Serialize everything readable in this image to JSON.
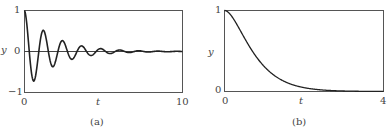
{
  "chart_data": [
    {
      "type": "line",
      "panel": "a",
      "caption": "(a)",
      "xlabel": "t",
      "ylabel": "y",
      "xlim": [
        0,
        10
      ],
      "ylim": [
        -1,
        1
      ],
      "xticks": [
        "0",
        "10"
      ],
      "yticks": [
        "1",
        "0",
        "−1"
      ],
      "grid": false,
      "zero_line": true,
      "model": "y = e^(-0.55 t) cos(5.2 t)",
      "series": [
        {
          "name": "y(t) underdamped",
          "x": [
            0,
            0.3,
            0.6,
            0.9,
            1.2,
            1.5,
            1.8,
            2.1,
            2.4,
            2.7,
            3.0,
            3.6,
            4.2,
            5.0,
            6.0,
            8.0,
            10.0
          ],
          "y": [
            1.0,
            0.0,
            -0.55,
            -0.05,
            0.25,
            0.02,
            -0.17,
            0.0,
            0.07,
            0.0,
            -0.04,
            0.02,
            -0.01,
            0.0,
            0.0,
            0.0,
            0.0
          ]
        }
      ]
    },
    {
      "type": "line",
      "panel": "b",
      "caption": "(b)",
      "xlabel": "t",
      "ylabel": "y",
      "xlim": [
        0,
        4
      ],
      "ylim": [
        0,
        1
      ],
      "xticks": [
        "0",
        "4"
      ],
      "yticks": [
        "1",
        "0"
      ],
      "grid": false,
      "model": "y = (1 + 2.4 t) e^(-2.4 t)",
      "series": [
        {
          "name": "y(t) critically damped",
          "x": [
            0,
            0.25,
            0.5,
            0.75,
            1.0,
            1.25,
            1.5,
            2.0,
            2.5,
            3.0,
            4.0
          ],
          "y": [
            1.0,
            0.88,
            0.66,
            0.46,
            0.31,
            0.2,
            0.13,
            0.05,
            0.02,
            0.01,
            0.0
          ]
        }
      ]
    }
  ],
  "panels": {
    "a": {
      "caption": "(a)",
      "xlabel": "t",
      "ylabel": "y",
      "xtick_min": "0",
      "xtick_max": "10",
      "ytick_top": "1",
      "ytick_mid": "0",
      "ytick_bot": "−1"
    },
    "b": {
      "caption": "(b)",
      "xlabel": "t",
      "ylabel": "y",
      "xtick_min": "0",
      "xtick_max": "4",
      "ytick_top": "1",
      "ytick_bot": "0"
    }
  },
  "style": {
    "axis_color": "#555555",
    "curve_color": "#222222"
  }
}
